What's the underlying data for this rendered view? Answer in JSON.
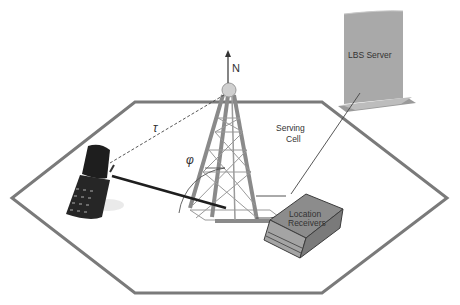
{
  "diagram": {
    "labels": {
      "north": "N",
      "tau": "τ",
      "phi": "φ",
      "serving_cell_line1": "Serving",
      "serving_cell_line2": "Cell",
      "lbs_server": "LBS Server",
      "location_receivers_line1": "Location",
      "location_receivers_line2": "Receivers"
    },
    "nodes": [
      {
        "id": "mobile-phone",
        "kind": "handset"
      },
      {
        "id": "base-station-tower",
        "kind": "antenna-tower"
      },
      {
        "id": "location-receivers",
        "kind": "receiver-box",
        "label": "Location Receivers"
      },
      {
        "id": "lbs-server",
        "kind": "server",
        "label": "LBS Server"
      },
      {
        "id": "serving-cell",
        "kind": "hexagon-cell",
        "label": "Serving Cell"
      }
    ],
    "edges": [
      {
        "from": "mobile-phone",
        "to": "base-station-tower",
        "style": "dashed",
        "label": "τ"
      },
      {
        "from": "mobile-phone",
        "to": "base-station-tower",
        "style": "solid-thick",
        "label": "φ"
      },
      {
        "from": "base-station-tower",
        "to": "location-receivers",
        "style": "solid"
      },
      {
        "from": "location-receivers",
        "to": "lbs-server",
        "style": "thin"
      }
    ],
    "colors": {
      "hexagon": "#7a7a7a",
      "tower": "#8a8a8a",
      "server": "#a9a9a9",
      "receiver": "#8c8c8c",
      "phone": "#1e1e1e"
    }
  }
}
